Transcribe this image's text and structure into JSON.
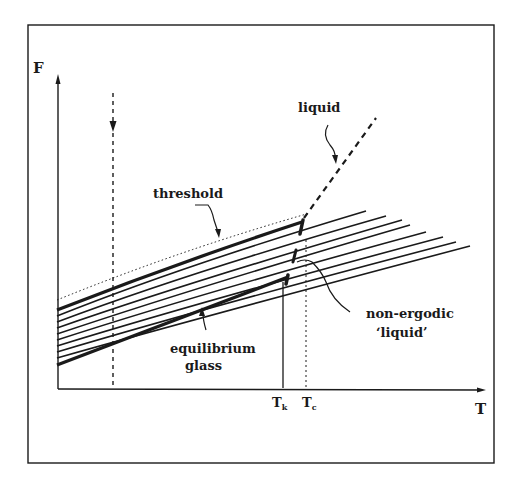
{
  "figure": {
    "axes": {
      "y_label": "F",
      "x_label": "T"
    },
    "ticks": {
      "tk_main": "T",
      "tk_sub": "k",
      "tc_main": "T",
      "tc_sub": "c"
    },
    "annotations": {
      "threshold": "threshold",
      "liquid": "liquid",
      "non_ergodic_line1": "non-ergodic",
      "non_ergodic_line2": "‘liquid’",
      "equilibrium_line1": "equilibrium",
      "equilibrium_line2": "glass"
    },
    "colors": {
      "ink": "#1a1a1a",
      "background": "#ffffff"
    },
    "curves": {
      "count_family": 9,
      "threshold_style": "thick",
      "equilibrium_glass_style": "thick",
      "upper_bound_style": "dotted",
      "liquid_style": "dashed"
    }
  }
}
